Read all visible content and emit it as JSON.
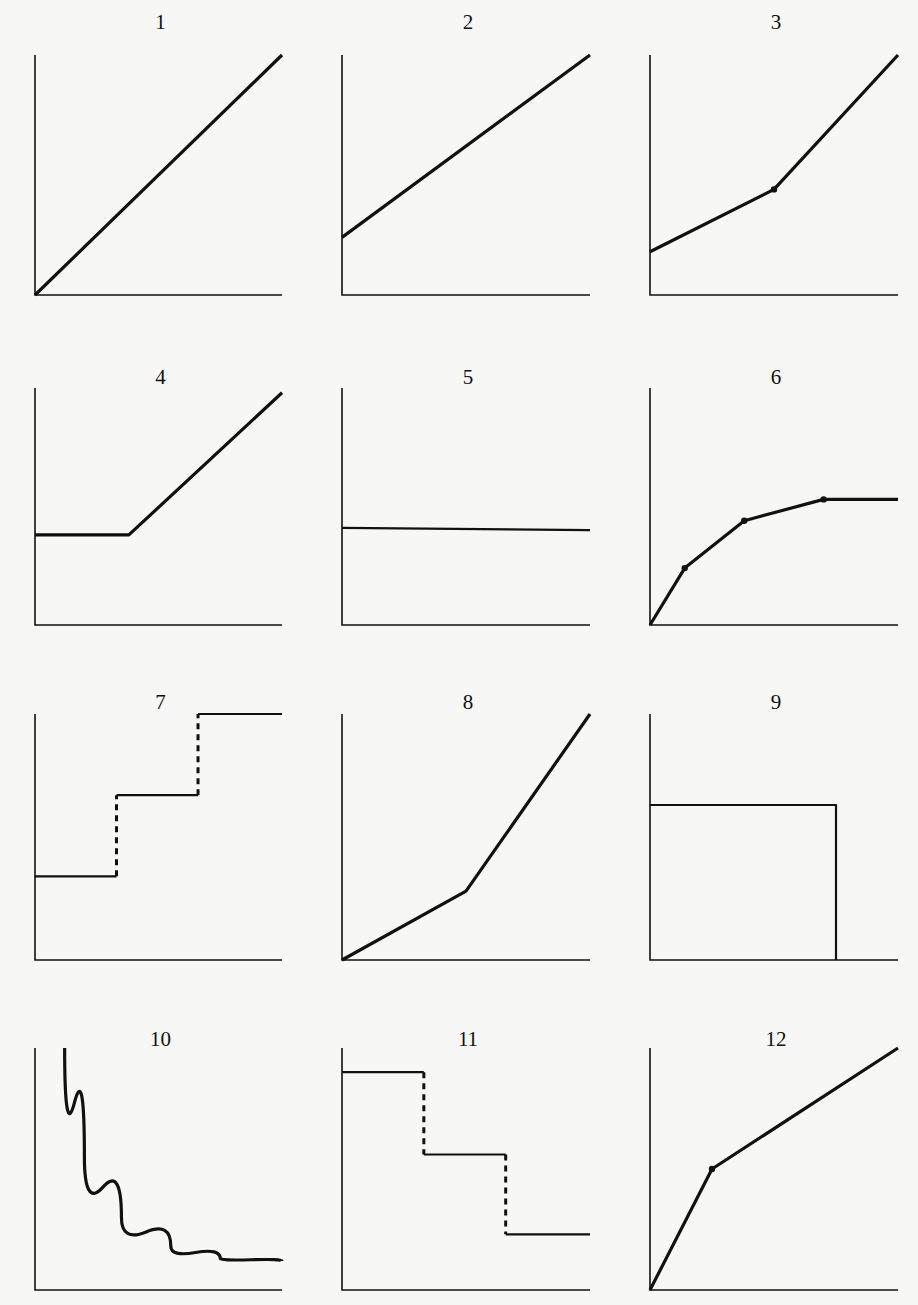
{
  "chart_data": [
    {
      "id": 1,
      "label": "1",
      "type": "line",
      "description": "Straight line from origin rising linearly",
      "segments": [
        {
          "points": [
            [
              0,
              0
            ],
            [
              1,
              1
            ]
          ],
          "style": "solid"
        }
      ],
      "dots": []
    },
    {
      "id": 2,
      "label": "2",
      "type": "line",
      "description": "Straight line with positive y-intercept rising linearly",
      "segments": [
        {
          "points": [
            [
              0,
              0.24
            ],
            [
              1,
              1
            ]
          ],
          "style": "solid"
        }
      ],
      "dots": []
    },
    {
      "id": 3,
      "label": "3",
      "type": "line",
      "description": "Positive intercept, shallow slope then steeper slope after breakpoint",
      "segments": [
        {
          "points": [
            [
              0,
              0.18
            ],
            [
              0.5,
              0.44
            ],
            [
              1,
              1
            ]
          ],
          "style": "solid"
        }
      ],
      "dots": [
        [
          0.5,
          0.44
        ]
      ]
    },
    {
      "id": 4,
      "label": "4",
      "type": "line",
      "description": "Flat at constant level, then rising linearly",
      "segments": [
        {
          "points": [
            [
              0,
              0.38
            ],
            [
              0.38,
              0.38
            ],
            [
              1,
              0.98
            ]
          ],
          "style": "solid"
        }
      ],
      "dots": []
    },
    {
      "id": 5,
      "label": "5",
      "type": "line",
      "description": "Horizontal line (constant)",
      "segments": [
        {
          "points": [
            [
              0,
              0.41
            ],
            [
              1,
              0.4
            ]
          ],
          "style": "solid"
        }
      ],
      "dots": []
    },
    {
      "id": 6,
      "label": "6",
      "type": "line",
      "description": "Concave increasing piecewise line then flat",
      "segments": [
        {
          "points": [
            [
              0,
              0
            ],
            [
              0.14,
              0.24
            ],
            [
              0.38,
              0.44
            ],
            [
              0.7,
              0.53
            ],
            [
              1,
              0.53
            ]
          ],
          "style": "solid"
        }
      ],
      "dots": [
        [
          0.14,
          0.24
        ],
        [
          0.38,
          0.44
        ],
        [
          0.7,
          0.53
        ]
      ]
    },
    {
      "id": 7,
      "label": "7",
      "type": "line",
      "description": "Step function increasing with dashed vertical risers",
      "segments": [
        {
          "points": [
            [
              0,
              0.34
            ],
            [
              0.33,
              0.34
            ]
          ],
          "style": "solid"
        },
        {
          "points": [
            [
              0.33,
              0.34
            ],
            [
              0.33,
              0.67
            ]
          ],
          "style": "dashed"
        },
        {
          "points": [
            [
              0.33,
              0.67
            ],
            [
              0.66,
              0.67
            ]
          ],
          "style": "solid"
        },
        {
          "points": [
            [
              0.66,
              0.67
            ],
            [
              0.66,
              1
            ]
          ],
          "style": "dashed"
        },
        {
          "points": [
            [
              0.66,
              1
            ],
            [
              1,
              1
            ]
          ],
          "style": "solid"
        }
      ],
      "dots": []
    },
    {
      "id": 8,
      "label": "8",
      "type": "line",
      "description": "From origin, shallow slope then steeper slope (convex)",
      "segments": [
        {
          "points": [
            [
              0,
              0
            ],
            [
              0.5,
              0.28
            ],
            [
              1,
              1
            ]
          ],
          "style": "solid"
        }
      ],
      "dots": []
    },
    {
      "id": 9,
      "label": "9",
      "type": "line",
      "description": "Constant level then drops vertically to zero",
      "segments": [
        {
          "points": [
            [
              0,
              0.63
            ],
            [
              0.75,
              0.63
            ],
            [
              0.75,
              0
            ]
          ],
          "style": "solid"
        }
      ],
      "dots": []
    },
    {
      "id": 10,
      "label": "10",
      "type": "line",
      "description": "Decreasing hyperbolic curve approaching horizontal asymptote",
      "segments": [
        {
          "curve": "hyperbola",
          "points": [
            [
              0.12,
              1
            ],
            [
              0.2,
              0.55
            ],
            [
              0.35,
              0.3
            ],
            [
              0.55,
              0.18
            ],
            [
              0.75,
              0.13
            ],
            [
              1,
              0.12
            ]
          ],
          "style": "solid"
        }
      ],
      "dots": []
    },
    {
      "id": 11,
      "label": "11",
      "type": "line",
      "description": "Step function decreasing with dashed vertical drops",
      "segments": [
        {
          "points": [
            [
              0,
              0.9
            ],
            [
              0.33,
              0.9
            ]
          ],
          "style": "solid"
        },
        {
          "points": [
            [
              0.33,
              0.9
            ],
            [
              0.33,
              0.56
            ]
          ],
          "style": "dashed"
        },
        {
          "points": [
            [
              0.33,
              0.56
            ],
            [
              0.66,
              0.56
            ]
          ],
          "style": "solid"
        },
        {
          "points": [
            [
              0.66,
              0.56
            ],
            [
              0.66,
              0.23
            ]
          ],
          "style": "dashed"
        },
        {
          "points": [
            [
              0.66,
              0.23
            ],
            [
              1,
              0.23
            ]
          ],
          "style": "solid"
        }
      ],
      "dots": []
    },
    {
      "id": 12,
      "label": "12",
      "type": "line",
      "description": "From origin, steep slope then shallower slope after breakpoint (concave)",
      "segments": [
        {
          "points": [
            [
              0,
              0
            ],
            [
              0.25,
              0.5
            ],
            [
              1,
              1
            ]
          ],
          "style": "solid"
        }
      ],
      "dots": [
        [
          0.25,
          0.5
        ]
      ]
    }
  ],
  "layout": {
    "columns_x": [
      [
        35,
        282
      ],
      [
        342,
        590
      ],
      [
        650,
        898
      ]
    ],
    "rows": [
      {
        "top": 55,
        "bottom": 295,
        "label_y": 10
      },
      {
        "top": 388,
        "bottom": 625,
        "label_y": 365
      },
      {
        "top": 714,
        "bottom": 960,
        "label_y": 690
      },
      {
        "top": 1048,
        "bottom": 1290,
        "label_y": 1027
      }
    ]
  },
  "colors": {
    "ink": "#111111",
    "background": "#f7f7f5"
  }
}
